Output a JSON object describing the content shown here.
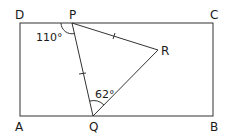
{
  "diagram": {
    "type": "geometry",
    "shape": "rectangle ABCD with triangle PQR inside",
    "vertices": {
      "A": "A",
      "B": "B",
      "C": "C",
      "D": "D",
      "P": "P",
      "Q": "Q",
      "R": "R"
    },
    "angles": {
      "DPQ": "110°",
      "PQR": "62°"
    },
    "equal_sides": [
      "PQ",
      "PR"
    ],
    "colors": {
      "line": "#333333",
      "text": "#1a1a1a",
      "background": "#ffffff"
    }
  }
}
